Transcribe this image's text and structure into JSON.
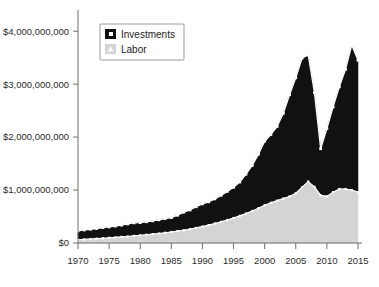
{
  "chart_data": {
    "type": "area",
    "title": "",
    "subtitle": "",
    "xlabel": "",
    "ylabel": "",
    "stacked": true,
    "grid": false,
    "legend_position": "top-left",
    "xlim": [
      1970,
      2015
    ],
    "ylim": [
      0,
      4400000000
    ],
    "xticks": [
      1970,
      1975,
      1980,
      1985,
      1990,
      1995,
      2000,
      2005,
      2010,
      2015
    ],
    "xtick_labels": [
      "1970",
      "1975",
      "1980",
      "1985",
      "1990",
      "1995",
      "2000",
      "2005",
      "2010",
      "2015"
    ],
    "yticks": [
      0,
      1000000000,
      2000000000,
      3000000000,
      4000000000
    ],
    "ytick_labels": [
      "$0",
      "$1,000,000,000",
      "$2,000,000,000",
      "$3,000,000,000",
      "$4,000,000,000"
    ],
    "x": [
      1970,
      1971,
      1972,
      1973,
      1974,
      1975,
      1976,
      1977,
      1978,
      1979,
      1980,
      1981,
      1982,
      1983,
      1984,
      1985,
      1986,
      1987,
      1988,
      1989,
      1990,
      1991,
      1992,
      1993,
      1994,
      1995,
      1996,
      1997,
      1998,
      1999,
      2000,
      2001,
      2002,
      2003,
      2004,
      2005,
      2006,
      2007,
      2008,
      2009,
      2010,
      2011,
      2012,
      2013,
      2014,
      2015
    ],
    "series": [
      {
        "name": "Labor",
        "color": "#d4d4d4",
        "marker": "triangle",
        "values": [
          60000000,
          68000000,
          75000000,
          82000000,
          90000000,
          98000000,
          106000000,
          115000000,
          124000000,
          134000000,
          145000000,
          156000000,
          168000000,
          180000000,
          194000000,
          208000000,
          224000000,
          242000000,
          262000000,
          285000000,
          310000000,
          338000000,
          368000000,
          400000000,
          435000000,
          472000000,
          512000000,
          556000000,
          604000000,
          656000000,
          712000000,
          760000000,
          800000000,
          840000000,
          880000000,
          940000000,
          1050000000,
          1160000000,
          1060000000,
          900000000,
          880000000,
          960000000,
          1020000000,
          1020000000,
          1000000000,
          960000000
        ]
      },
      {
        "name": "Investments",
        "color": "#111111",
        "marker": "square",
        "values": [
          170000000,
          178000000,
          185000000,
          192000000,
          200000000,
          206000000,
          214000000,
          222000000,
          236000000,
          246000000,
          240000000,
          244000000,
          250000000,
          258000000,
          266000000,
          272000000,
          300000000,
          340000000,
          362000000,
          400000000,
          430000000,
          440000000,
          465000000,
          500000000,
          540000000,
          580000000,
          640000000,
          744000000,
          860000000,
          1020000000,
          1210000000,
          1290000000,
          1400000000,
          1610000000,
          1920000000,
          2180000000,
          2440000000,
          2390000000,
          1780000000,
          880000000,
          1280000000,
          1610000000,
          1930000000,
          2260000000,
          2740000000,
          2490000000
        ]
      }
    ],
    "total_line": {
      "name": "Total",
      "color": "#ffffff",
      "values": [
        230000000,
        246000000,
        260000000,
        274000000,
        290000000,
        304000000,
        320000000,
        337000000,
        360000000,
        380000000,
        385000000,
        400000000,
        418000000,
        438000000,
        460000000,
        480000000,
        524000000,
        582000000,
        624000000,
        685000000,
        740000000,
        778000000,
        833000000,
        900000000,
        975000000,
        1052000000,
        1152000000,
        1300000000,
        1464000000,
        1676000000,
        1922000000,
        2050000000,
        2200000000,
        2450000000,
        2800000000,
        3120000000,
        3490000000,
        3550000000,
        2840000000,
        1780000000,
        2160000000,
        2570000000,
        2950000000,
        3280000000,
        3740000000,
        3450000000
      ]
    },
    "legend": [
      {
        "label": "Investments",
        "color": "#111111"
      },
      {
        "label": "Labor",
        "color": "#d4d4d4"
      }
    ]
  }
}
